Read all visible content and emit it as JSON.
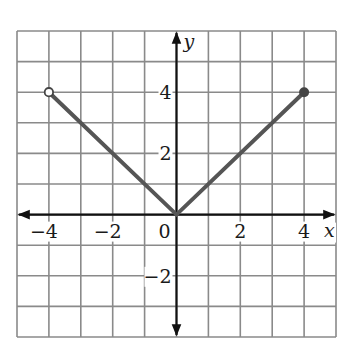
{
  "chart_data": {
    "type": "line",
    "title": "",
    "xlabel": "x",
    "ylabel": "y",
    "xlim": [
      -5,
      5
    ],
    "ylim": [
      -4,
      6
    ],
    "grid": true,
    "grid_step": 1,
    "legend": null,
    "x_tick_labels": [
      "-4",
      "-2",
      "0",
      "2",
      "4"
    ],
    "y_tick_labels": [
      "4",
      "2",
      "-2"
    ],
    "series": [
      {
        "name": "f(x) = |x|, -4 < x ≤ 4",
        "x": [
          -4,
          0,
          4
        ],
        "y": [
          4,
          0,
          4
        ],
        "color": "#555555"
      }
    ],
    "endpoints": [
      {
        "x": -4,
        "y": 4,
        "style": "open"
      },
      {
        "x": 4,
        "y": 4,
        "style": "closed"
      }
    ]
  },
  "labels": {
    "x_axis": "x",
    "y_axis": "y",
    "origin": "0",
    "x_ticks": [
      {
        "value": -4,
        "text": "−4"
      },
      {
        "value": -2,
        "text": "−2"
      },
      {
        "value": 2,
        "text": "2"
      },
      {
        "value": 4,
        "text": "4"
      }
    ],
    "y_ticks": [
      {
        "value": 4,
        "text": "4"
      },
      {
        "value": 2,
        "text": "2"
      },
      {
        "value": -2,
        "text": "−2"
      }
    ]
  },
  "colors": {
    "grid": "#8a8a8a",
    "axis": "#111111",
    "line": "#555555",
    "background": "#ffffff"
  }
}
